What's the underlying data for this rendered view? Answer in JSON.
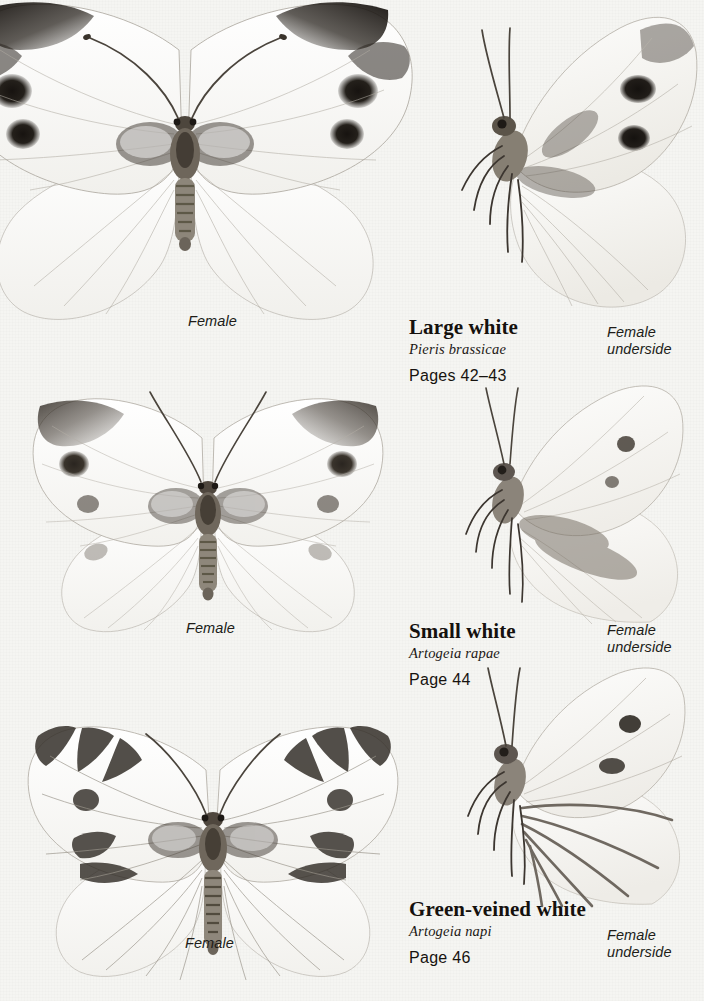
{
  "page": {
    "kind": "field-guide-plate",
    "background_color": "#f4f4f1",
    "ink_color": "#2a2520"
  },
  "species": [
    {
      "id": "large-white",
      "common_name": "Large white",
      "latin_name": "Pieris brassicae",
      "pages": "Pages 42–43",
      "upper_caption": "Female",
      "under_caption_line1": "Female",
      "under_caption_line2": "underside",
      "figures": [
        {
          "name": "large-white-female-upperside",
          "view": "spread-wings-dorsal"
        },
        {
          "name": "large-white-female-underside",
          "view": "side-profile-ventral"
        }
      ]
    },
    {
      "id": "small-white",
      "common_name": "Small white",
      "latin_name": "Artogeia rapae",
      "pages": "Page 44",
      "upper_caption": "Female",
      "under_caption_line1": "Female",
      "under_caption_line2": "underside",
      "figures": [
        {
          "name": "small-white-female-upperside",
          "view": "spread-wings-dorsal"
        },
        {
          "name": "small-white-female-underside",
          "view": "side-profile-ventral"
        }
      ]
    },
    {
      "id": "green-veined-white",
      "common_name": "Green-veined white",
      "latin_name": "Artogeia napi",
      "pages": "Page 46",
      "upper_caption": "Female",
      "under_caption_line1": "Female",
      "under_caption_line2": "underside",
      "figures": [
        {
          "name": "green-veined-white-female-upperside",
          "view": "spread-wings-dorsal"
        },
        {
          "name": "green-veined-white-female-underside",
          "view": "side-profile-ventral"
        }
      ]
    }
  ]
}
